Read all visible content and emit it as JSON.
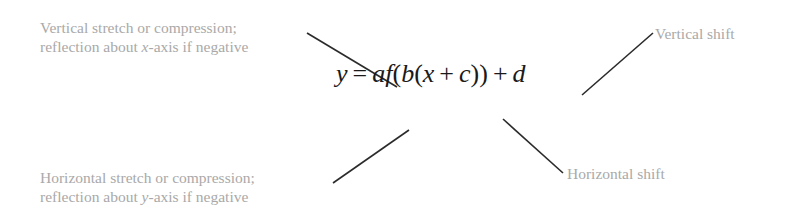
{
  "diagram": {
    "formula": {
      "y": "y",
      "equals": "=",
      "a": "a",
      "f": "f",
      "open1": "(",
      "b": "b",
      "open2": "(",
      "x": "x",
      "plus1": "+",
      "c": "c",
      "close": "))",
      "plus2": "+",
      "d": "d"
    },
    "labels": {
      "vertical_stretch": {
        "line1": "Vertical stretch or compression;",
        "line2_prefix": "reflection about ",
        "line2_var": "x",
        "line2_suffix": "-axis if negative"
      },
      "vertical_shift": {
        "line1": "Vertical shift"
      },
      "horizontal_stretch": {
        "line1": "Horizontal stretch or compression;",
        "line2_prefix": "reflection about ",
        "line2_var": "y",
        "line2_suffix": "-axis if negative"
      },
      "horizontal_shift": {
        "line1": "Horizontal shift"
      }
    },
    "colors": {
      "label_text": "#a9a9a9",
      "formula_text": "#1a1a1a",
      "leader_line": "#2b2b2b",
      "background": "#ffffff"
    }
  }
}
